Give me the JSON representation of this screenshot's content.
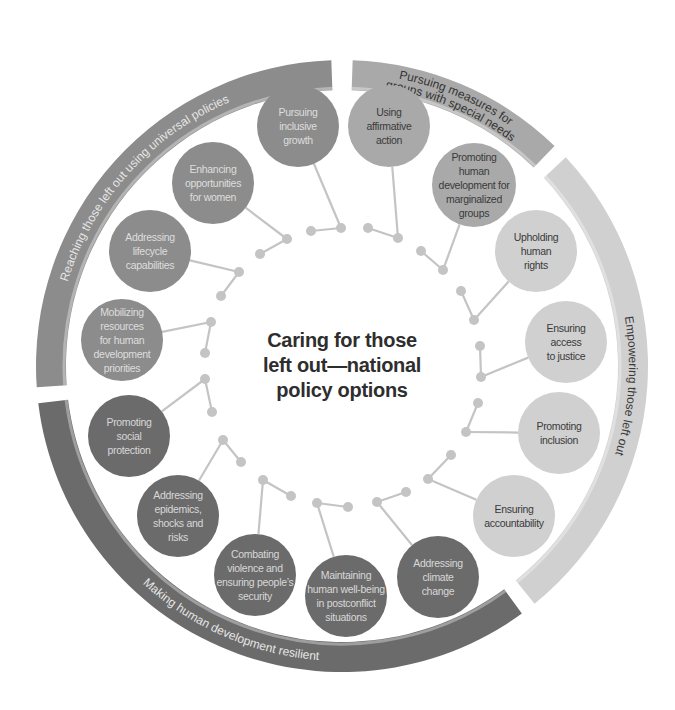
{
  "title": {
    "lines": [
      "Caring for those",
      "left out—national",
      "policy options"
    ]
  },
  "colors": {
    "universal": "#8c8c8c",
    "special_needs": "#a9a9a9",
    "empowering": "#d0d0d0",
    "resilient": "#6b6b6b",
    "connector": "#c4c4c4",
    "title": "#2e2e2e"
  },
  "ring": {
    "center": [
      342,
      366
    ],
    "outer_radius": 306,
    "thickness": 30
  },
  "groups": [
    {
      "id": "universal",
      "label": "Reaching those left out using universal policies",
      "start_deg": 266,
      "end_deg": 358,
      "fill": "#8c8c8c",
      "text_color": "#e6e6e6",
      "node_fill": "#8c8c8c",
      "node_text": "#dedede"
    },
    {
      "id": "special_needs",
      "label_lines": [
        "Pursuing measures for",
        "groups with special needs"
      ],
      "label": "Pursuing measures for groups with special needs",
      "start_deg": 2,
      "end_deg": 44,
      "fill": "#a9a9a9",
      "text_color": "#333333",
      "node_fill": "#a9a9a9",
      "node_text": "#3a3a3a"
    },
    {
      "id": "empowering",
      "label": "Empowering those left out",
      "start_deg": 47,
      "end_deg": 141,
      "fill": "#d0d0d0",
      "text_color": "#3a3a3a",
      "node_fill": "#d0d0d0",
      "node_text": "#3a3a3a"
    },
    {
      "id": "resilient",
      "label": "Making human development resilient",
      "start_deg": 144,
      "end_deg": 263,
      "fill": "#6b6b6b",
      "text_color": "#e6e6e6",
      "node_fill": "#6b6b6b",
      "node_text": "#d8d8d8"
    }
  ],
  "nodes": [
    {
      "group": "universal",
      "lines": [
        "Pursuing",
        "inclusive",
        "growth"
      ],
      "cx": 298,
      "cy": 126,
      "r": 41,
      "dots": [
        [
          341,
          228
        ],
        [
          311,
          231
        ]
      ]
    },
    {
      "group": "special_needs",
      "lines": [
        "Using",
        "affirmative",
        "action"
      ],
      "cx": 389,
      "cy": 126,
      "r": 41,
      "dots": [
        [
          398,
          238
        ],
        [
          368,
          228
        ]
      ]
    },
    {
      "group": "special_needs",
      "lines": [
        "Promoting",
        "human",
        "development for",
        "marginalized",
        "groups"
      ],
      "cx": 474,
      "cy": 185,
      "r": 42,
      "dots": [
        [
          443,
          270
        ],
        [
          421,
          251
        ]
      ]
    },
    {
      "group": "empowering",
      "lines": [
        "Upholding",
        "human",
        "rights"
      ],
      "cx": 536,
      "cy": 251,
      "r": 41,
      "dots": [
        [
          474,
          320
        ],
        [
          461,
          291
        ]
      ]
    },
    {
      "group": "empowering",
      "lines": [
        "Ensuring",
        "access",
        "to justice"
      ],
      "cx": 566,
      "cy": 342,
      "r": 41,
      "dots": [
        [
          481,
          377
        ],
        [
          480,
          346
        ]
      ]
    },
    {
      "group": "empowering",
      "lines": [
        "Promoting",
        "inclusion"
      ],
      "cx": 559,
      "cy": 433,
      "r": 41,
      "dots": [
        [
          466,
          432
        ],
        [
          478,
          403
        ]
      ]
    },
    {
      "group": "empowering",
      "lines": [
        "Ensuring",
        "accountability"
      ],
      "cx": 514,
      "cy": 516,
      "r": 41,
      "dots": [
        [
          428,
          479
        ],
        [
          451,
          455
        ]
      ]
    },
    {
      "group": "resilient",
      "lines": [
        "Addressing",
        "climate",
        "change"
      ],
      "cx": 438,
      "cy": 577,
      "r": 41,
      "dots": [
        [
          377,
          502
        ],
        [
          406,
          492
        ]
      ]
    },
    {
      "group": "resilient",
      "lines": [
        "Maintaining",
        "human well-being",
        "in postconflict",
        "situations"
      ],
      "cx": 346,
      "cy": 596,
      "r": 41,
      "dots": [
        [
          317,
          503
        ],
        [
          348,
          507
        ]
      ]
    },
    {
      "group": "resilient",
      "lines": [
        "Combating",
        "violence and",
        "ensuring people’s",
        "security"
      ],
      "cx": 255,
      "cy": 575,
      "r": 41,
      "dots": [
        [
          263,
          480
        ],
        [
          291,
          496
        ]
      ]
    },
    {
      "group": "resilient",
      "lines": [
        "Addressing",
        "epidemics,",
        "shocks and",
        "risks"
      ],
      "cx": 178,
      "cy": 516,
      "r": 41,
      "dots": [
        [
          223,
          440
        ],
        [
          241,
          462
        ]
      ]
    },
    {
      "group": "resilient",
      "lines": [
        "Promoting",
        "social",
        "protection"
      ],
      "cx": 129,
      "cy": 436,
      "r": 41,
      "dots": [
        [
          205,
          379
        ],
        [
          212,
          412
        ]
      ]
    },
    {
      "group": "universal",
      "lines": [
        "Mobilizing",
        "resources",
        "for human",
        "development",
        "priorities"
      ],
      "cx": 122,
      "cy": 340,
      "r": 41,
      "dots": [
        [
          211,
          322
        ],
        [
          205,
          353
        ]
      ]
    },
    {
      "group": "universal",
      "lines": [
        "Addressing",
        "lifecycle",
        "capabilities"
      ],
      "cx": 150,
      "cy": 251,
      "r": 41,
      "dots": [
        [
          239,
          272
        ],
        [
          221,
          296
        ]
      ]
    },
    {
      "group": "universal",
      "lines": [
        "Enhancing",
        "opportunities",
        "for women"
      ],
      "cx": 213,
      "cy": 183,
      "r": 41,
      "dots": [
        [
          287,
          239
        ],
        [
          260,
          254
        ]
      ]
    }
  ]
}
